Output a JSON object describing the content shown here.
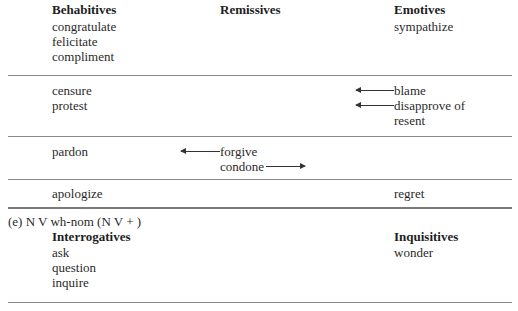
{
  "table1": {
    "headers": {
      "col1": "Behabitives",
      "col2": "Remissives",
      "col3": "Emotives"
    },
    "rows": [
      {
        "col1": [
          "congratulate",
          "felicitate",
          "compliment"
        ],
        "col2": [],
        "col3": [
          "sympathize"
        ]
      },
      {
        "col1": [
          "censure",
          "protest"
        ],
        "col2": [],
        "col3": [
          "blame",
          "disapprove of",
          "resent"
        ],
        "arrows": [
          {
            "to": "blame",
            "direction": "left"
          },
          {
            "to": "disapprove of",
            "direction": "left"
          }
        ]
      },
      {
        "col1": [
          "pardon"
        ],
        "col2": [
          "forgive",
          "condone"
        ],
        "col3": [],
        "arrows": [
          {
            "from": "forgive",
            "direction": "left"
          },
          {
            "from": "condone",
            "direction": "right"
          }
        ]
      },
      {
        "col1": [
          "apologize"
        ],
        "col2": [],
        "col3": [
          "regret"
        ]
      }
    ]
  },
  "section_e": {
    "label": "(e) N V wh-nom (N V + )",
    "headers": {
      "col1": "Interrogatives",
      "col3": "Inquisitives"
    },
    "col1": [
      "ask",
      "question",
      "inquire"
    ],
    "col3": [
      "wonder"
    ]
  }
}
